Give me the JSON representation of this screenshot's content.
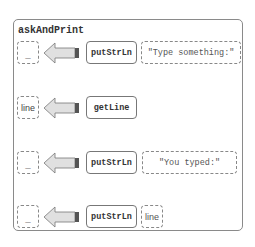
{
  "diagram": {
    "title": "askAndPrint",
    "rows": [
      {
        "result": "_",
        "function": "putStrLn",
        "argument": "\"Type something:\""
      },
      {
        "result": "line",
        "function": "getLine",
        "argument": null
      },
      {
        "result": "_",
        "function": "putStrLn",
        "argument": "\"You typed:\""
      },
      {
        "result": "_",
        "function": "putStrLn",
        "argument": "line"
      }
    ]
  },
  "colors": {
    "border": "#8a8a8a",
    "arrow_fill": "#e0e0e0",
    "arrow_bar": "#555555"
  }
}
